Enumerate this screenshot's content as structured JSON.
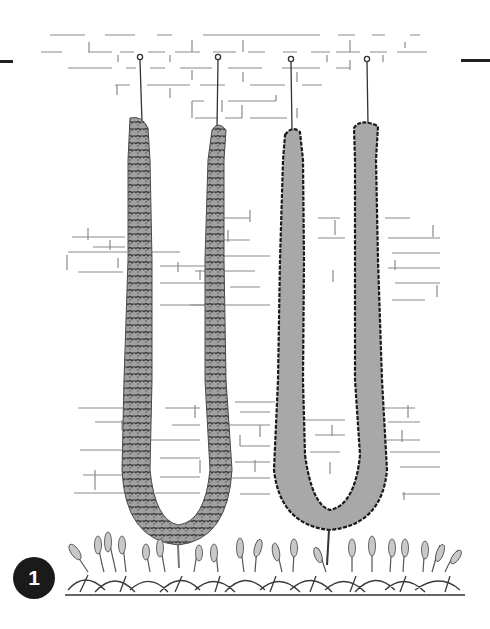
{
  "figure": {
    "step_number": "1",
    "elements": {
      "wall": "brick-wall",
      "left_form": "leafy-ivy-u-frame",
      "right_form": "solid-silhouette-u-frame",
      "hooks": 4,
      "ground": "flowering-plant-bed"
    }
  },
  "colors": {
    "background": "#ffffff",
    "ink": "#1a1a1a",
    "brick_line": "#8a8a8a",
    "foliage_fill": "#9a9a9a",
    "foliage_dark": "#3c3c3c",
    "silhouette_fill": "#a8a8a8"
  }
}
